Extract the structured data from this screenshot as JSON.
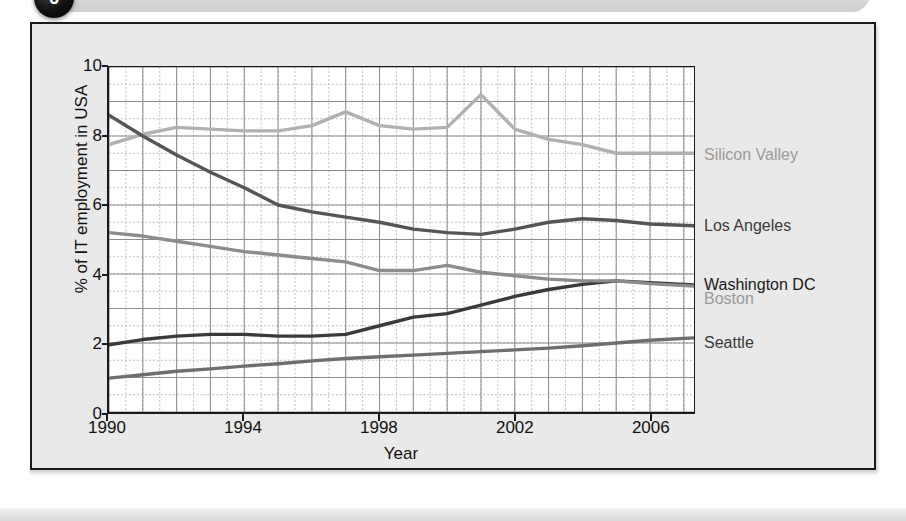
{
  "header": {
    "badge_number": "6",
    "title": "Changes in IT employment by city"
  },
  "chart_data": {
    "type": "line",
    "title": "Changes in IT employment by city",
    "xlabel": "Year",
    "ylabel": "% of IT employment in USA",
    "xlim": [
      1990,
      2007.3
    ],
    "ylim": [
      0,
      10
    ],
    "xticks": [
      "1990",
      "1994",
      "1998",
      "2002",
      "2006"
    ],
    "xtick_values": [
      1990,
      1994,
      1998,
      2002,
      2006
    ],
    "yticks": [
      "0",
      "2",
      "4",
      "6",
      "8",
      "10"
    ],
    "ytick_values": [
      0,
      2,
      4,
      6,
      8,
      10
    ],
    "grid": true,
    "grid_major_x_step": 1,
    "grid_major_y_step": 1,
    "grid_minor_x_step": 0.5,
    "grid_minor_y_step": 0.5,
    "legend_position": "right-of-line-ends",
    "x": [
      1990,
      1991,
      1992,
      1993,
      1994,
      1995,
      1996,
      1997,
      1998,
      1999,
      2000,
      2001,
      2002,
      2003,
      2004,
      2005,
      2006,
      2007.3
    ],
    "series": [
      {
        "name": "Silicon Valley",
        "color": "#b0b0b0",
        "label_color": "#9a9a9a",
        "label_y": 7.45,
        "values": [
          7.75,
          8.05,
          8.25,
          8.2,
          8.15,
          8.15,
          8.3,
          8.7,
          8.3,
          8.2,
          8.25,
          9.2,
          8.2,
          7.9,
          7.75,
          7.5,
          7.5,
          7.5
        ]
      },
      {
        "name": "Los Angeles",
        "color": "#555555",
        "label_color": "#3a3a3a",
        "label_y": 5.4,
        "values": [
          8.6,
          8.0,
          7.45,
          6.95,
          6.5,
          6.0,
          5.8,
          5.65,
          5.5,
          5.3,
          5.2,
          5.15,
          5.3,
          5.5,
          5.6,
          5.55,
          5.45,
          5.4
        ]
      },
      {
        "name": "Washington DC",
        "color": "#3a3a3a",
        "label_color": "#1a1a1a",
        "label_y": 3.72,
        "values": [
          1.95,
          2.1,
          2.2,
          2.25,
          2.25,
          2.2,
          2.2,
          2.25,
          2.5,
          2.75,
          2.85,
          3.1,
          3.35,
          3.55,
          3.7,
          3.8,
          3.75,
          3.68
        ]
      },
      {
        "name": "Boston",
        "color": "#8c8c8c",
        "label_color": "#9a9a9a",
        "label_y": 3.3,
        "values": [
          5.2,
          5.1,
          4.95,
          4.8,
          4.65,
          4.55,
          4.45,
          4.35,
          4.1,
          4.1,
          4.25,
          4.05,
          3.95,
          3.85,
          3.8,
          3.8,
          3.72,
          3.65
        ]
      },
      {
        "name": "Seattle",
        "color": "#6e6e6e",
        "label_color": "#3a3a3a",
        "label_y": 2.05,
        "values": [
          0.98,
          1.08,
          1.18,
          1.25,
          1.33,
          1.4,
          1.48,
          1.55,
          1.6,
          1.65,
          1.7,
          1.75,
          1.8,
          1.85,
          1.92,
          2.0,
          2.08,
          2.15
        ]
      }
    ]
  }
}
